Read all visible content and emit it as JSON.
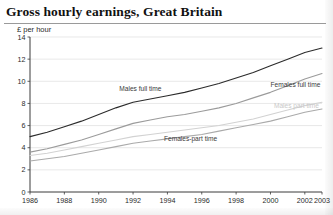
{
  "chart_data": {
    "type": "line",
    "title": "Gross hourly earnings, Great Britain",
    "subtitle": "£ per hour",
    "ylabel": "£ per hour",
    "xlabel": "",
    "ylim": [
      0,
      14
    ],
    "yticks": [
      0,
      2,
      4,
      6,
      8,
      10,
      12,
      14
    ],
    "xlim": [
      1986,
      2003
    ],
    "xticks": [
      1986,
      1988,
      1990,
      1992,
      1994,
      1996,
      1998,
      2000,
      2002,
      2003
    ],
    "xtick_labels": [
      "1986",
      "1988",
      "1990",
      "1992",
      "1994",
      "1996",
      "1998",
      "2000",
      "2002",
      "2003"
    ],
    "ytick_labels": [
      "0",
      "2",
      "4",
      "6",
      "8",
      "10",
      "12",
      "14"
    ],
    "grid": true,
    "legend_position": "inline-annotations",
    "x": [
      1986,
      1987,
      1988,
      1989,
      1990,
      1991,
      1992,
      1993,
      1994,
      1995,
      1996,
      1997,
      1998,
      1999,
      2000,
      2001,
      2002,
      2003
    ],
    "series": [
      {
        "name": "Males full time",
        "label": "Males full time",
        "color": "#2b2b2b",
        "label_x": 1991.2,
        "label_y": 9.1,
        "values": [
          5.0,
          5.4,
          5.9,
          6.4,
          7.0,
          7.6,
          8.1,
          8.4,
          8.7,
          9.0,
          9.4,
          9.8,
          10.3,
          10.8,
          11.4,
          12.0,
          12.6,
          13.0
        ]
      },
      {
        "name": "Females full time",
        "label": "Females full time",
        "color": "#9b9b9b",
        "label_x": 2000.0,
        "label_y": 9.5,
        "values": [
          3.6,
          3.9,
          4.3,
          4.7,
          5.2,
          5.7,
          6.2,
          6.5,
          6.8,
          7.0,
          7.3,
          7.6,
          8.0,
          8.5,
          9.0,
          9.6,
          10.2,
          10.7
        ]
      },
      {
        "name": "Males part time",
        "label": "Males part time",
        "color": "#d2d2d2",
        "label_x": 2000.2,
        "label_y": 7.6,
        "values": [
          3.3,
          3.5,
          3.8,
          4.1,
          4.4,
          4.7,
          5.0,
          5.2,
          5.4,
          5.6,
          5.8,
          6.0,
          6.3,
          6.6,
          7.0,
          7.4,
          7.8,
          8.1
        ]
      },
      {
        "name": "Females part time",
        "label": "Females-part time",
        "color": "#aaaaaa",
        "label_x": 1993.8,
        "label_y": 4.6,
        "values": [
          2.8,
          3.0,
          3.2,
          3.5,
          3.8,
          4.1,
          4.4,
          4.6,
          4.8,
          5.0,
          5.2,
          5.5,
          5.8,
          6.1,
          6.4,
          6.8,
          7.2,
          7.5
        ]
      }
    ]
  }
}
